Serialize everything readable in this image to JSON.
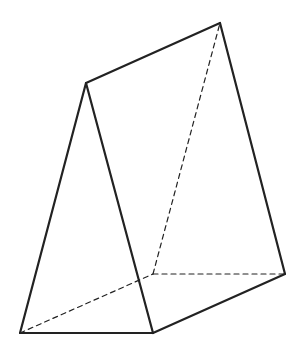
{
  "diagram": {
    "type": "triangular-prism",
    "stroke_color": "#222222",
    "background": "#ffffff",
    "vertices": {
      "A": {
        "x": 86,
        "y": 83
      },
      "B": {
        "x": 220,
        "y": 23
      },
      "C": {
        "x": 20,
        "y": 333
      },
      "D": {
        "x": 153,
        "y": 333
      },
      "E": {
        "x": 285,
        "y": 274
      },
      "F": {
        "x": 153,
        "y": 274
      }
    },
    "solid_edges": [
      [
        "A",
        "B"
      ],
      [
        "A",
        "C"
      ],
      [
        "A",
        "D"
      ],
      [
        "C",
        "D"
      ],
      [
        "B",
        "E"
      ],
      [
        "D",
        "E"
      ]
    ],
    "dashed_edges": [
      [
        "C",
        "F"
      ],
      [
        "F",
        "E"
      ],
      [
        "F",
        "B"
      ]
    ]
  }
}
